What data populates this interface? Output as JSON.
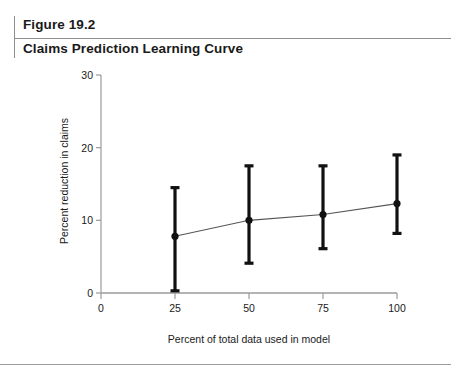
{
  "header": {
    "figure_number": "Figure 19.2",
    "figure_title": "Claims Prediction Learning Curve"
  },
  "chart_data": {
    "type": "line",
    "title": "Claims Prediction Learning Curve",
    "subtitle": "",
    "xlabel": "Percent of total data used in model",
    "ylabel": "Percent reduction in claims",
    "x": [
      25,
      50,
      75,
      100
    ],
    "values": [
      7.8,
      10.0,
      10.8,
      12.3
    ],
    "error_low": [
      0.3,
      4.1,
      6.1,
      8.2
    ],
    "error_high": [
      14.5,
      17.5,
      17.5,
      19.0
    ],
    "series": [
      {
        "name": "Percent reduction in claims",
        "values": [
          7.8,
          10.0,
          10.8,
          12.3
        ]
      }
    ],
    "xlim": [
      0,
      100
    ],
    "ylim": [
      0,
      30
    ],
    "xticks": [
      0,
      25,
      50,
      75,
      100
    ],
    "yticks": [
      0,
      10,
      20,
      30
    ],
    "xtick_labels": [
      "0",
      "25",
      "50",
      "75",
      "100"
    ],
    "ytick_labels": [
      "0",
      "10",
      "20",
      "30"
    ],
    "grid": false,
    "legend": false,
    "legend_position": "none",
    "marker": "filled-circle",
    "errorbar_style": "capped",
    "line_color": "#555555",
    "marker_color": "#111111",
    "errorbar_color": "#111111",
    "axis_color": "#9b9b9b"
  }
}
